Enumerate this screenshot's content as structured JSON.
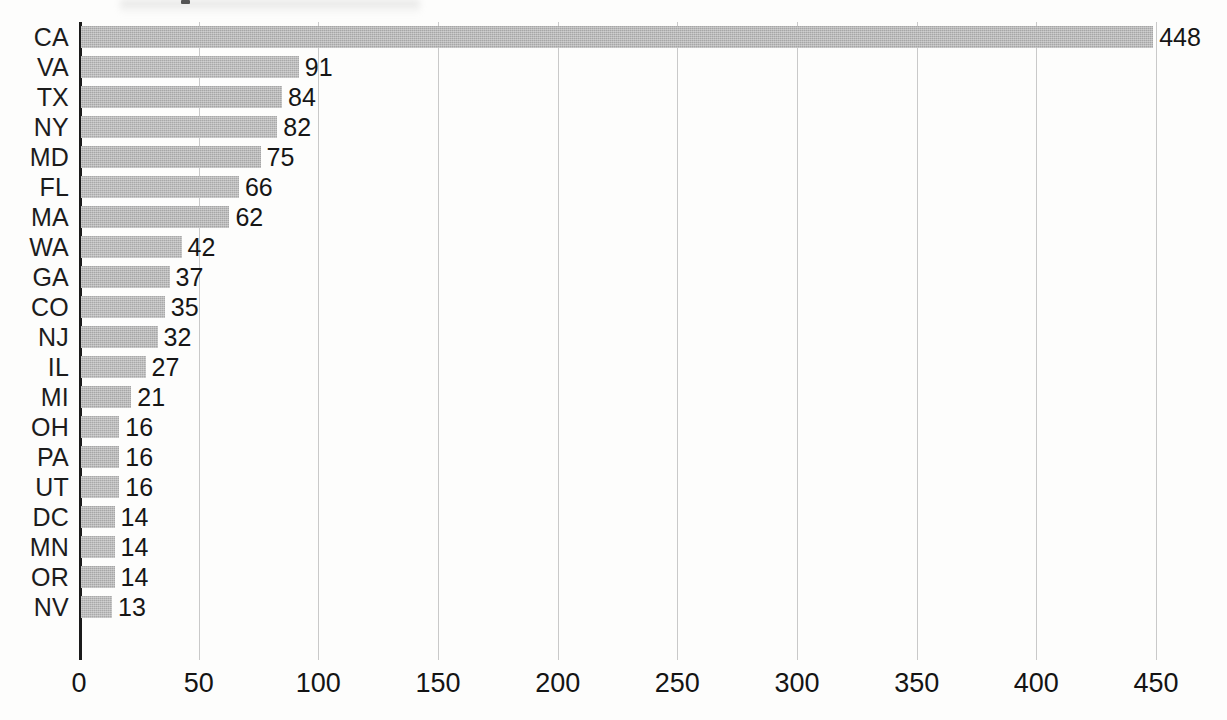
{
  "chart_data": {
    "type": "bar",
    "orientation": "horizontal",
    "title": "",
    "subtitle": "",
    "xlabel": "",
    "ylabel": "",
    "xlim": [
      0,
      450
    ],
    "ylim": null,
    "grid": "vertical",
    "legend": "none",
    "xticks": [
      0,
      50,
      100,
      150,
      200,
      250,
      300,
      350,
      400,
      450
    ],
    "xtick_labels": [
      "0",
      "50",
      "100",
      "150",
      "200",
      "250",
      "300",
      "350",
      "400",
      "450"
    ],
    "categories": [
      "CA",
      "VA",
      "TX",
      "NY",
      "MD",
      "FL",
      "MA",
      "WA",
      "GA",
      "CO",
      "NJ",
      "IL",
      "MI",
      "OH",
      "PA",
      "UT",
      "DC",
      "MN",
      "OR",
      "NV"
    ],
    "values": [
      448,
      91,
      84,
      82,
      75,
      66,
      62,
      42,
      37,
      35,
      32,
      27,
      21,
      16,
      16,
      16,
      14,
      14,
      14,
      13
    ],
    "data_labels": [
      "448",
      "91",
      "84",
      "82",
      "75",
      "66",
      "62",
      "42",
      "37",
      "35",
      "32",
      "27",
      "21",
      "16",
      "16",
      "16",
      "14",
      "14",
      "14",
      "13"
    ],
    "bars": [
      {
        "category": "CA",
        "value": 448,
        "label": "448"
      },
      {
        "category": "VA",
        "value": 91,
        "label": "91"
      },
      {
        "category": "TX",
        "value": 84,
        "label": "84"
      },
      {
        "category": "NY",
        "value": 82,
        "label": "82"
      },
      {
        "category": "MD",
        "value": 75,
        "label": "75"
      },
      {
        "category": "FL",
        "value": 66,
        "label": "66"
      },
      {
        "category": "MA",
        "value": 62,
        "label": "62"
      },
      {
        "category": "WA",
        "value": 42,
        "label": "42"
      },
      {
        "category": "GA",
        "value": 37,
        "label": "37"
      },
      {
        "category": "CO",
        "value": 35,
        "label": "35"
      },
      {
        "category": "NJ",
        "value": 32,
        "label": "32"
      },
      {
        "category": "IL",
        "value": 27,
        "label": "27"
      },
      {
        "category": "MI",
        "value": 21,
        "label": "21"
      },
      {
        "category": "OH",
        "value": 16,
        "label": "16"
      },
      {
        "category": "PA",
        "value": 16,
        "label": "16"
      },
      {
        "category": "UT",
        "value": 16,
        "label": "16"
      },
      {
        "category": "DC",
        "value": 14,
        "label": "14"
      },
      {
        "category": "MN",
        "value": 14,
        "label": "14"
      },
      {
        "category": "OR",
        "value": 14,
        "label": "14"
      },
      {
        "category": "NV",
        "value": 13,
        "label": "13"
      }
    ],
    "colors": {
      "bar_fill": "#a6a6a6",
      "axis": "#1b1b1b",
      "gridline": "#c9c9c9",
      "text": "#161616",
      "background": "#fdfdfc"
    }
  }
}
